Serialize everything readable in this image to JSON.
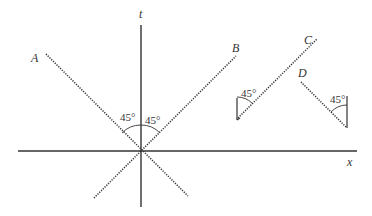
{
  "diagram": {
    "type": "spacetime-diagram",
    "axes": {
      "time_label": "t",
      "space_label": "x"
    },
    "worldlines": [
      {
        "id": "A",
        "label": "A",
        "style": "dotted",
        "direction": "down-right"
      },
      {
        "id": "B",
        "label": "B",
        "style": "dotted",
        "direction": "up-right"
      },
      {
        "id": "C",
        "label": "C",
        "style": "dotted",
        "direction": "up-right"
      },
      {
        "id": "D",
        "label": "D",
        "style": "dotted",
        "direction": "down-right"
      }
    ],
    "angles": {
      "origin_left": "45°",
      "origin_right": "45°",
      "C_angle": "45°",
      "D_angle": "45°"
    },
    "colors": {
      "ink": "#333333",
      "background": "#ffffff"
    }
  }
}
